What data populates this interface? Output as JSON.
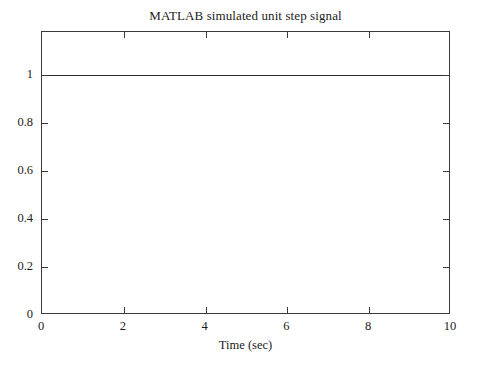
{
  "chart_data": {
    "type": "line",
    "title": "MATLAB simulated unit step signal",
    "xlabel": "Time (sec)",
    "ylabel": "",
    "xlim": [
      0,
      10
    ],
    "ylim": [
      0,
      1.18
    ],
    "grid": false,
    "legend": null,
    "xticks": [
      0,
      2,
      4,
      6,
      8,
      10
    ],
    "xtick_labels": [
      "0",
      "2",
      "4",
      "6",
      "8",
      "10"
    ],
    "yticks": [
      0,
      0.2,
      0.4,
      0.6,
      0.8,
      1
    ],
    "ytick_labels": [
      "0",
      "0.2",
      "0.4",
      "0.6",
      "0.8",
      "1"
    ],
    "tick_direction": "in",
    "series": [
      {
        "name": "unit step",
        "color": "#2b2b2b",
        "x": [
          0,
          1,
          2,
          3,
          4,
          5,
          6,
          7,
          8,
          9,
          10
        ],
        "values": [
          1,
          1,
          1,
          1,
          1,
          1,
          1,
          1,
          1,
          1,
          1
        ]
      }
    ]
  }
}
